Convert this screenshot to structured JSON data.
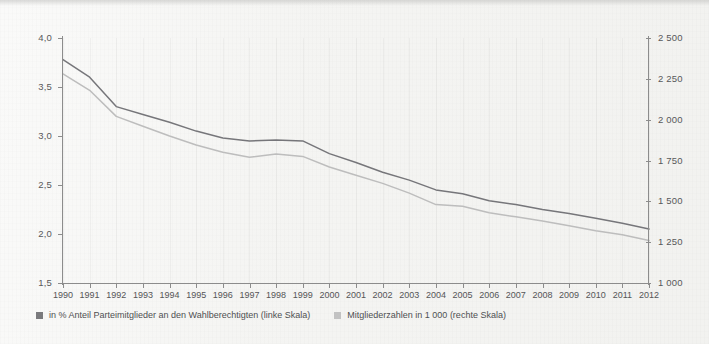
{
  "chart_data": {
    "type": "line",
    "title": "",
    "subtitle": "",
    "xlabel": "",
    "ylabel": "",
    "grid": "vertical-light",
    "legend_position": "bottom-left",
    "categories": [
      "1990",
      "1991",
      "1992",
      "1993",
      "1994",
      "1995",
      "1996",
      "1997",
      "1998",
      "1999",
      "2000",
      "2001",
      "2002",
      "2003",
      "2004",
      "2005",
      "2006",
      "2007",
      "2008",
      "2009",
      "2010",
      "2011",
      "2012"
    ],
    "axes": {
      "left": {
        "label": "in % Anteil Parteimitglieder an den Wahlberechtigten",
        "ticks": [
          "1,5",
          "2,0",
          "2,5",
          "3,0",
          "3,5",
          "4,0"
        ],
        "tick_values": [
          1.5,
          2.0,
          2.5,
          3.0,
          3.5,
          4.0
        ],
        "ylim": [
          1.5,
          4.0
        ]
      },
      "right": {
        "label": "Mitgliederzahlen in 1 000",
        "ticks": [
          "1 000",
          "1 250",
          "1 500",
          "1 750",
          "2 000",
          "2 250",
          "2 500"
        ],
        "tick_values": [
          1000,
          1250,
          1500,
          1750,
          2000,
          2250,
          2500
        ],
        "ylim": [
          1000,
          2500
        ]
      }
    },
    "series": [
      {
        "name": "in % Anteil Parteimitglieder an den Wahlberechtigten (linke Skala)",
        "axis": "left",
        "color": "#76767a",
        "values": [
          3.78,
          3.6,
          3.3,
          3.22,
          3.14,
          3.05,
          2.98,
          2.95,
          2.96,
          2.95,
          2.82,
          2.73,
          2.63,
          2.55,
          2.45,
          2.41,
          2.34,
          2.3,
          2.25,
          2.21,
          2.16,
          2.11,
          2.05
        ]
      },
      {
        "name": "Mitgliederzahlen in 1 000 (rechte Skala)",
        "axis": "right",
        "color": "#bdbdbd",
        "values": [
          2280,
          2180,
          2020,
          1960,
          1900,
          1845,
          1800,
          1770,
          1790,
          1775,
          1710,
          1660,
          1610,
          1550,
          1480,
          1470,
          1430,
          1405,
          1380,
          1350,
          1320,
          1295,
          1260
        ]
      }
    ]
  },
  "legend": {
    "items": [
      {
        "label": "in % Anteil Parteimitglieder an den Wahlberechtigten (linke Skala)",
        "color": "#7a7a7d"
      },
      {
        "label": "Mitgliederzahlen in 1 000 (rechte Skala)",
        "color": "#c2c2c2"
      }
    ]
  }
}
